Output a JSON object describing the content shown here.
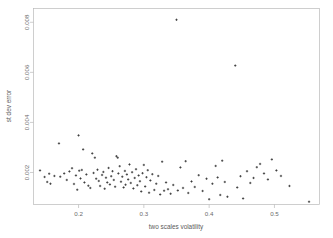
{
  "chart_data": {
    "type": "scatter",
    "title": "",
    "xlabel": "two scales volatility",
    "ylabel": "st dev error",
    "xlim": [
      0.131,
      0.569
    ],
    "ylim": [
      0.00072,
      0.00855
    ],
    "xticks": [
      0.2,
      0.3,
      0.4,
      0.5
    ],
    "xtick_labels": [
      "0.2",
      "0.3",
      "0.4",
      "0.5"
    ],
    "yticks": [
      0.002,
      0.004,
      0.006,
      0.008
    ],
    "ytick_labels": [
      "0.002",
      "0.004",
      "0.006",
      "0.008"
    ],
    "grid": false,
    "legend": null,
    "marker": "plus",
    "marker_color": "#2b2b2b",
    "n_points": 115,
    "points": [
      [
        0.141,
        0.00208
      ],
      [
        0.148,
        0.00182
      ],
      [
        0.152,
        0.00162
      ],
      [
        0.155,
        0.00195
      ],
      [
        0.157,
        0.00155
      ],
      [
        0.163,
        0.00186
      ],
      [
        0.17,
        0.00316
      ],
      [
        0.172,
        0.00183
      ],
      [
        0.178,
        0.00196
      ],
      [
        0.182,
        0.0017
      ],
      [
        0.186,
        0.00204
      ],
      [
        0.19,
        0.00217
      ],
      [
        0.193,
        0.00154
      ],
      [
        0.196,
        0.00188
      ],
      [
        0.198,
        0.00131
      ],
      [
        0.2,
        0.00348
      ],
      [
        0.201,
        0.00207
      ],
      [
        0.203,
        0.00176
      ],
      [
        0.205,
        0.0021
      ],
      [
        0.207,
        0.00292
      ],
      [
        0.209,
        0.0016
      ],
      [
        0.212,
        0.00192
      ],
      [
        0.215,
        0.00147
      ],
      [
        0.218,
        0.00138
      ],
      [
        0.221,
        0.00276
      ],
      [
        0.223,
        0.00198
      ],
      [
        0.225,
        0.00259
      ],
      [
        0.227,
        0.00175
      ],
      [
        0.229,
        0.00211
      ],
      [
        0.231,
        0.00166
      ],
      [
        0.233,
        0.00146
      ],
      [
        0.236,
        0.0019
      ],
      [
        0.238,
        0.00202
      ],
      [
        0.24,
        0.00135
      ],
      [
        0.242,
        0.00179
      ],
      [
        0.244,
        0.0016
      ],
      [
        0.246,
        0.00218
      ],
      [
        0.248,
        0.00152
      ],
      [
        0.25,
        0.00185
      ],
      [
        0.252,
        0.00205
      ],
      [
        0.254,
        0.0017
      ],
      [
        0.256,
        0.00143
      ],
      [
        0.258,
        0.00265
      ],
      [
        0.26,
        0.00259
      ],
      [
        0.261,
        0.00196
      ],
      [
        0.263,
        0.00225
      ],
      [
        0.265,
        0.00163
      ],
      [
        0.267,
        0.00183
      ],
      [
        0.269,
        0.0014
      ],
      [
        0.271,
        0.00206
      ],
      [
        0.272,
        0.00151
      ],
      [
        0.274,
        0.00192
      ],
      [
        0.276,
        0.00172
      ],
      [
        0.278,
        0.00232
      ],
      [
        0.28,
        0.00158
      ],
      [
        0.282,
        0.00201
      ],
      [
        0.284,
        0.00136
      ],
      [
        0.286,
        0.00178
      ],
      [
        0.288,
        0.00213
      ],
      [
        0.29,
        0.00149
      ],
      [
        0.292,
        0.00188
      ],
      [
        0.294,
        0.00165
      ],
      [
        0.296,
        0.00124
      ],
      [
        0.298,
        0.00197
      ],
      [
        0.3,
        0.0023
      ],
      [
        0.302,
        0.00144
      ],
      [
        0.304,
        0.00181
      ],
      [
        0.306,
        0.00209
      ],
      [
        0.308,
        0.00119
      ],
      [
        0.31,
        0.00168
      ],
      [
        0.313,
        0.00193
      ],
      [
        0.316,
        0.0013
      ],
      [
        0.319,
        0.00155
      ],
      [
        0.322,
        0.00186
      ],
      [
        0.325,
        0.00112
      ],
      [
        0.328,
        0.00243
      ],
      [
        0.331,
        0.00127
      ],
      [
        0.334,
        0.0016
      ],
      [
        0.337,
        0.00133
      ],
      [
        0.341,
        0.00115
      ],
      [
        0.345,
        0.0015
      ],
      [
        0.35,
        0.0081
      ],
      [
        0.352,
        0.00128
      ],
      [
        0.356,
        0.0022
      ],
      [
        0.36,
        0.00138
      ],
      [
        0.364,
        0.00245
      ],
      [
        0.368,
        0.00118
      ],
      [
        0.373,
        0.00164
      ],
      [
        0.378,
        0.00142
      ],
      [
        0.384,
        0.00189
      ],
      [
        0.39,
        0.00126
      ],
      [
        0.396,
        0.00175
      ],
      [
        0.4,
        0.00093
      ],
      [
        0.405,
        0.00155
      ],
      [
        0.41,
        0.00226
      ],
      [
        0.413,
        0.0018
      ],
      [
        0.417,
        0.0011
      ],
      [
        0.42,
        0.00247
      ],
      [
        0.424,
        0.00162
      ],
      [
        0.428,
        0.00103
      ],
      [
        0.44,
        0.00627
      ],
      [
        0.443,
        0.0014
      ],
      [
        0.448,
        0.00185
      ],
      [
        0.452,
        0.00096
      ],
      [
        0.458,
        0.00205
      ],
      [
        0.463,
        0.00158
      ],
      [
        0.468,
        0.00178
      ],
      [
        0.473,
        0.00221
      ],
      [
        0.478,
        0.00234
      ],
      [
        0.484,
        0.00196
      ],
      [
        0.49,
        0.00172
      ],
      [
        0.496,
        0.00252
      ],
      [
        0.503,
        0.00208
      ],
      [
        0.51,
        0.00186
      ],
      [
        0.523,
        0.00146
      ],
      [
        0.553,
        0.00083
      ]
    ]
  },
  "axes": {
    "x_title": "two scales volatility",
    "y_title": "st dev error"
  }
}
